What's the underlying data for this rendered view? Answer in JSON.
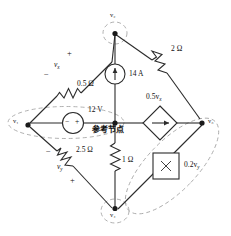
{
  "figure": {
    "type": "circuit-schematic"
  },
  "nodes": [
    {
      "id": "n1",
      "label": "v",
      "sub": "1",
      "x": 18,
      "y": 123
    },
    {
      "id": "n2",
      "label": "v",
      "sub": "2",
      "x": 115,
      "y": 27
    },
    {
      "id": "n3",
      "label": "v",
      "sub": "3",
      "x": 212,
      "y": 123
    },
    {
      "id": "n4",
      "label": "v",
      "sub": "4",
      "x": 115,
      "y": 214
    },
    {
      "id": "nref",
      "label": "",
      "sub": "",
      "x": 115,
      "y": 123
    }
  ],
  "node_labels": {
    "v1": "v₁",
    "v2": "v₂",
    "v3": "v₃",
    "v4": "v₄"
  },
  "reference_node": {
    "text": "参考节点",
    "meaning": "reference node"
  },
  "components": [
    {
      "name": "resistor-0p5",
      "label": "0.5 Ω",
      "kind": "resistor"
    },
    {
      "name": "resistor-2",
      "label": "2 Ω",
      "kind": "resistor"
    },
    {
      "name": "resistor-2p5",
      "label": "2.5 Ω",
      "kind": "resistor"
    },
    {
      "name": "resistor-1",
      "label": "1 Ω",
      "kind": "resistor"
    },
    {
      "name": "current-source-14a",
      "label": "14 A",
      "kind": "independent-current-source"
    },
    {
      "name": "voltage-source-12v",
      "label": "12 V",
      "kind": "independent-voltage-source"
    },
    {
      "name": "dependent-current-source-0p5vx",
      "label": "0.5v",
      "sub": "x",
      "kind": "dependent-current-source"
    },
    {
      "name": "dependent-source-0p2vy",
      "label": "0.2v",
      "sub": "y",
      "kind": "dependent-source-box"
    }
  ],
  "labels": {
    "r_half": "0.5 Ω",
    "r_two": "2 Ω",
    "r_twofive": "2.5 Ω",
    "r_one": "1 Ω",
    "i_14a": "14 A",
    "v_12v": "12 V",
    "dep_i": "0.5v",
    "dep_i_sub": "x",
    "dep_b": "0.2v",
    "dep_b_sub": "y",
    "vx": "v",
    "vx_sub": "x",
    "vy": "v",
    "vy_sub": "y",
    "plus": "+",
    "minus": "−",
    "box_mark": "×"
  },
  "polarity": {
    "vx_plus": "+",
    "vx_minus": "−",
    "vy_plus": "+",
    "vy_minus": "−",
    "src12_minus": "−",
    "src12_plus": "+"
  },
  "colors": {
    "wire": "#2b2b2b",
    "supernode_dash": "#9a9a9a",
    "background": "#ffffff",
    "text": "#111111"
  },
  "supernodes": [
    {
      "name": "supernode-left",
      "shape": "ellipse",
      "encloses": [
        "v1",
        "reference-node"
      ]
    },
    {
      "name": "supernode-right",
      "shape": "ellipse",
      "encloses": [
        "v3",
        "v4"
      ]
    },
    {
      "name": "supernode-top",
      "shape": "ellipse",
      "encloses": [
        "v2"
      ]
    },
    {
      "name": "supernode-bottom",
      "shape": "ellipse",
      "encloses": [
        "v4"
      ]
    }
  ]
}
